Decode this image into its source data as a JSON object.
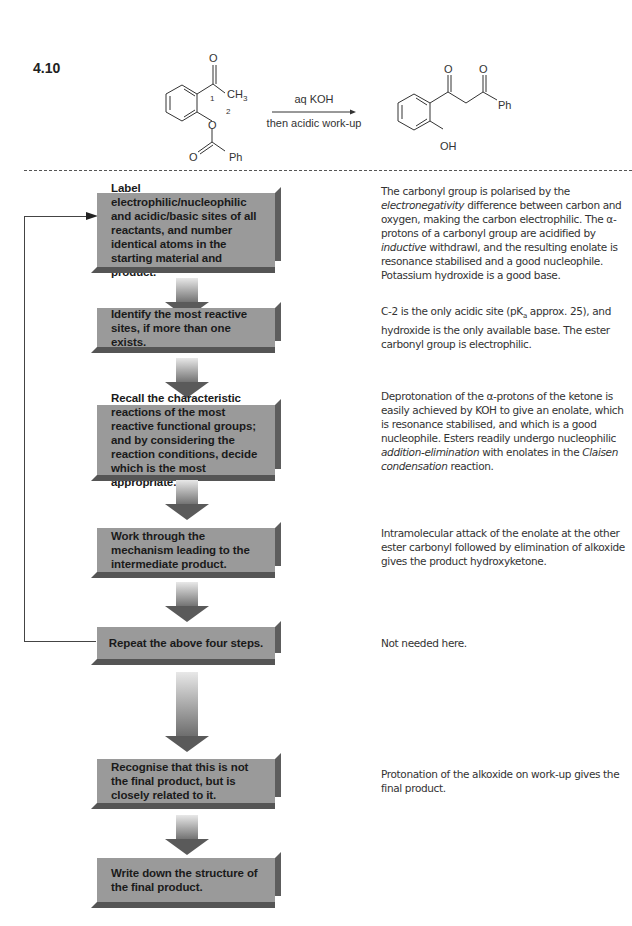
{
  "problem": {
    "number": "4.10"
  },
  "scheme": {
    "reactant": {
      "labels": [
        "O",
        "CH3",
        "1",
        "2",
        "O",
        "O",
        "Ph"
      ],
      "carbonyl_o": "O",
      "methyl": "CH",
      "methyl_sub": "3",
      "atom_num_1": "1",
      "atom_num_2": "2",
      "ester_o": "O",
      "ester_carbonyl_o": "O",
      "phenyl": "Ph"
    },
    "conditions": {
      "line1": "aq KOH",
      "line2": "then acidic work-up"
    },
    "product": {
      "carbonyl_o1": "O",
      "carbonyl_o2": "O",
      "phenyl": "Ph",
      "hydroxyl": "OH"
    }
  },
  "flowchart": {
    "steps": [
      {
        "label": "Label electrophilic/nucleophilic and acidic/basic sites of all reactants, and number identical atoms in the starting material and product."
      },
      {
        "label": "Identify the most reactive sites, if more than one exists."
      },
      {
        "label": "Recall the characteristic reactions of the most reactive functional groups; and by considering the reaction conditions, decide which is the most appropriate."
      },
      {
        "label": "Work through the mechanism leading to the intermediate product."
      },
      {
        "label": "Repeat the above four steps."
      },
      {
        "label": "Recognise that this is not the final product, but is closely related to it."
      },
      {
        "label": "Write down the structure of the final product."
      }
    ],
    "feedback_loop": "Repeat → back to step 1"
  },
  "notes": {
    "step1": {
      "t1": "The carbonyl group is polarised by the ",
      "i1": "electronegativity",
      "t2": " difference between carbon and oxygen, making the carbon electrophilic. The α-protons of a carbonyl group are acidified by ",
      "i2": "inductive",
      "t3": " withdrawl, and the resulting enolate is resonance stabilised and a good nucleophile. Potassium hydroxide is a good base."
    },
    "step2": {
      "t1": "C-2 is the only acidic site (pK",
      "sub": "a",
      "t2": " approx. 25), and hydroxide is the only available base. The ester carbonyl group is electrophilic."
    },
    "step3": {
      "t1": "Deprotonation of the α-protons of the ketone is easily achieved by KOH to give an enolate, which is resonance stabilised, and which is a good nucleophile. Esters readily undergo nucleophilic ",
      "i1": "addition-elimination",
      "t2": " with enolates in the ",
      "i2": "Claisen condensation",
      "t3": " reaction."
    },
    "step4": {
      "t1": "Intramolecular attack of the enolate at the other ester carbonyl followed by elimination of alkoxide gives the product hydroxyketone."
    },
    "step5": {
      "t1": "Not needed here."
    },
    "step6": {
      "t1": "Protonation of the alkoxide on work-up gives the final product."
    }
  },
  "colors": {
    "box_fill": "#9a9a9a",
    "box_edge": "#5d5d5d",
    "arrow_dark": "#5a5a5a",
    "arrow_light": "#e8e8e8",
    "text": "#222222"
  }
}
